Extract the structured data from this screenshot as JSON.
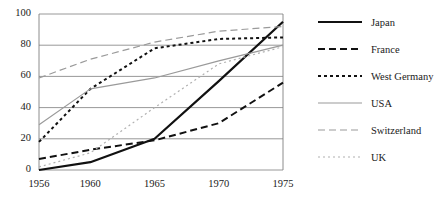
{
  "chart_data": {
    "type": "line",
    "title": "",
    "xlabel": "",
    "ylabel": "",
    "x": [
      1956,
      1960,
      1965,
      1970,
      1975
    ],
    "xtick_labels": [
      "1956",
      "1960",
      "1965",
      "1970",
      "1975"
    ],
    "ytick_labels": [
      "0",
      "20",
      "40",
      "60",
      "80",
      "100"
    ],
    "yticks": [
      0,
      20,
      40,
      60,
      80,
      100
    ],
    "xlim": [
      1956,
      1975
    ],
    "ylim": [
      0,
      100
    ],
    "grid": "horizontal",
    "legend_position": "right",
    "series": [
      {
        "name": "Japan",
        "values": [
          0,
          5,
          20,
          57,
          95
        ],
        "color": "#111111",
        "style": "solid",
        "width": 2.2,
        "dash": ""
      },
      {
        "name": "France",
        "values": [
          7,
          13,
          19,
          30,
          56
        ],
        "color": "#111111",
        "style": "dashed",
        "width": 2.0,
        "dash": "7,4"
      },
      {
        "name": "West Germany",
        "values": [
          18,
          52,
          78,
          84,
          85
        ],
        "color": "#111111",
        "style": "dotted",
        "width": 2.0,
        "dash": "3,3"
      },
      {
        "name": "USA",
        "values": [
          29,
          52,
          59,
          70,
          80
        ],
        "color": "#9a9a9a",
        "style": "solid",
        "width": 1.2,
        "dash": ""
      },
      {
        "name": "Switzerland",
        "values": [
          59,
          71,
          82,
          89,
          92
        ],
        "color": "#9a9a9a",
        "style": "dashed",
        "width": 1.2,
        "dash": "7,4"
      },
      {
        "name": "UK",
        "values": [
          2,
          11,
          40,
          68,
          79
        ],
        "color": "#b0b0b0",
        "style": "dotted",
        "width": 1.2,
        "dash": "2,3"
      }
    ]
  },
  "axes": {
    "frame_color": "#808080",
    "grid_color": "#8c8c8c",
    "background": "#ffffff"
  }
}
